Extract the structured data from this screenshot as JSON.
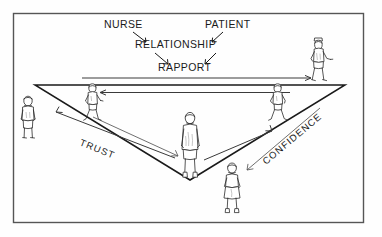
{
  "diagram": {
    "title_absent": true,
    "frame": {
      "color": "#555555"
    },
    "labels": {
      "nurse": "NURSE",
      "patient": "PATIENT",
      "relationship": "RELATIONSHIP",
      "rapport": "RAPPORT",
      "trust": "TRUST",
      "confidence": "CONFIDENCE"
    },
    "ink_color": "#1a1a1a",
    "background": "#ffffff",
    "arrows": [
      {
        "name": "nurse-to-relationship",
        "from": "NURSE",
        "to": "RELATIONSHIP",
        "direction": "down-right"
      },
      {
        "name": "patient-to-relationship",
        "from": "PATIENT",
        "to": "RELATIONSHIP",
        "direction": "down-left"
      },
      {
        "name": "relationship-to-rapport-left",
        "from": "RELATIONSHIP",
        "to": "RAPPORT",
        "direction": "down-right"
      },
      {
        "name": "relationship-to-rapport-right",
        "from": "RELATIONSHIP",
        "to": "RAPPORT",
        "direction": "down-left"
      },
      {
        "name": "rapport-arrow-rightward",
        "direction": "right"
      },
      {
        "name": "rapport-arrow-leftward",
        "direction": "left"
      },
      {
        "name": "trust-arrow-up-left",
        "direction": "up-left"
      },
      {
        "name": "trust-arrow-down-right",
        "direction": "down-right"
      },
      {
        "name": "confidence-arrow-up-right",
        "direction": "up-right"
      },
      {
        "name": "confidence-arrow-down-left",
        "direction": "down-left"
      }
    ],
    "figures": [
      {
        "name": "figure-left-vertex",
        "pose": "standing",
        "x": 28,
        "y": 125
      },
      {
        "name": "figure-upper-left-walking",
        "pose": "walking",
        "x": 92,
        "y": 103
      },
      {
        "name": "figure-center-standing",
        "pose": "standing",
        "x": 190,
        "y": 145
      },
      {
        "name": "figure-upper-right-walking",
        "pose": "walking",
        "x": 277,
        "y": 103
      },
      {
        "name": "figure-top-right-nurse",
        "pose": "walking-with-cap",
        "x": 318,
        "y": 58
      },
      {
        "name": "figure-bottom-right",
        "pose": "standing-skirt",
        "x": 232,
        "y": 193
      }
    ]
  }
}
